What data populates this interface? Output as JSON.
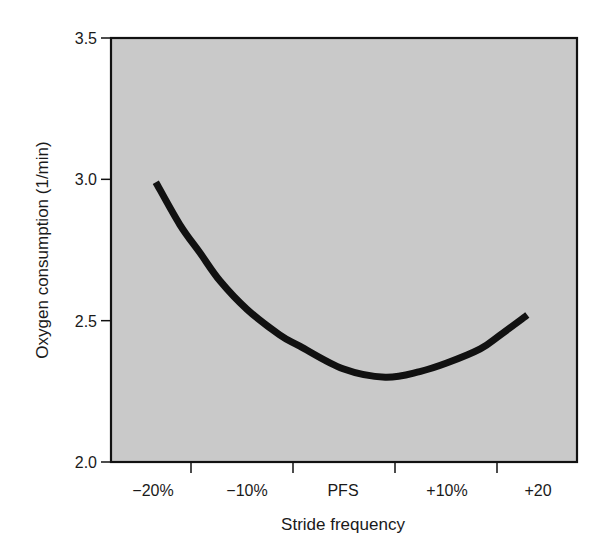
{
  "chart_data": {
    "type": "line",
    "title": "",
    "xlabel": "Stride frequency",
    "ylabel": "Oxygen consumption (1/min)",
    "ylim": [
      2.0,
      3.5
    ],
    "xlim": [
      -25,
      25
    ],
    "grid": false,
    "legend": null,
    "x_tick_labels": [
      "−20%",
      "−10%",
      "PFS",
      "+10%",
      "+20"
    ],
    "x_tick_positions": [
      -20,
      -10,
      0,
      10,
      20
    ],
    "y_tick_labels": [
      "2.0",
      "2.5",
      "3.0",
      "3.5"
    ],
    "y_ticks": [
      2.0,
      2.5,
      3.0,
      3.5
    ],
    "background_color": "#c9c9c9",
    "line_color": "#111111",
    "series": [
      {
        "name": "Oxygen consumption",
        "x": [
          -19.5,
          -17,
          -14.9,
          -12.8,
          -10,
          -6.6,
          -4.5,
          0,
          4.4,
          8,
          10.8,
          14.3,
          16.4,
          19.2
        ],
        "values": [
          2.99,
          2.84,
          2.74,
          2.64,
          2.54,
          2.45,
          2.41,
          2.33,
          2.3,
          2.32,
          2.35,
          2.4,
          2.45,
          2.52
        ]
      }
    ],
    "annotations": []
  }
}
